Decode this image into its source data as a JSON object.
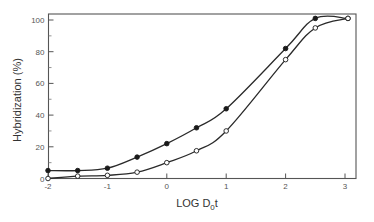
{
  "chart_data": {
    "type": "line",
    "title": "",
    "xlabel": "LOG D0t",
    "xlabel_main": "LOG D",
    "xlabel_sub": "0",
    "xlabel_tail": "t",
    "ylabel": "Hybridization (%)",
    "xlim": [
      -2,
      3.2
    ],
    "ylim": [
      0,
      105
    ],
    "x_ticks": [
      -2,
      -1,
      0,
      1,
      2,
      3
    ],
    "x_tick_labels": [
      "-2",
      "-1",
      "0",
      "1",
      "2",
      "3"
    ],
    "y_ticks": [
      0,
      20,
      40,
      60,
      80,
      100
    ],
    "y_tick_labels": [
      "0",
      "20",
      "40",
      "60",
      "80",
      "100"
    ],
    "y_minor_ticks": [
      10,
      30,
      50,
      70,
      90
    ],
    "grid": false,
    "legend": null,
    "series": [
      {
        "name": "filled circles",
        "marker": "filled-circle",
        "x": [
          -2,
          -1.5,
          -1,
          -0.5,
          0,
          0.5,
          1,
          2,
          2.5,
          3.05
        ],
        "y": [
          5,
          5,
          6.5,
          13.5,
          22,
          32,
          44,
          82,
          101,
          101
        ]
      },
      {
        "name": "open circles",
        "marker": "open-circle",
        "x": [
          -2,
          -1.5,
          -1,
          -0.5,
          0,
          0.5,
          1,
          2,
          2.5,
          3.05
        ],
        "y": [
          0,
          1.5,
          2,
          4,
          10,
          17.5,
          30,
          75,
          95,
          101
        ]
      }
    ]
  }
}
